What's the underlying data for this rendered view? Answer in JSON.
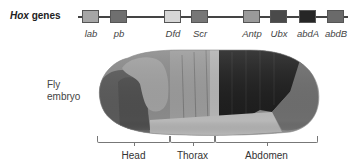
{
  "title": {
    "prefix": "Hox",
    "suffix": " genes"
  },
  "genes": [
    {
      "name": "lab",
      "color": "#a6a6a6",
      "x": 82
    },
    {
      "name": "pb",
      "color": "#6f6f6f",
      "x": 110
    },
    {
      "name": "Dfd",
      "color": "#d6d6d6",
      "x": 164
    },
    {
      "name": "Scr",
      "color": "#777777",
      "x": 191
    },
    {
      "name": "Antp",
      "color": "#9a9a9a",
      "x": 243
    },
    {
      "name": "Ubx",
      "color": "#4a4a4a",
      "x": 270
    },
    {
      "name": "abdA",
      "color": "#262626",
      "x": 299
    },
    {
      "name": "abdB",
      "color": "#6a6a6a",
      "x": 327
    }
  ],
  "embryo_label": {
    "line1": "Fly",
    "line2": "embryo"
  },
  "regions": [
    {
      "name": "Head",
      "x": 97,
      "width": 73
    },
    {
      "name": "Thorax",
      "x": 170,
      "width": 45
    },
    {
      "name": "Abdomen",
      "x": 215,
      "width": 103
    }
  ]
}
